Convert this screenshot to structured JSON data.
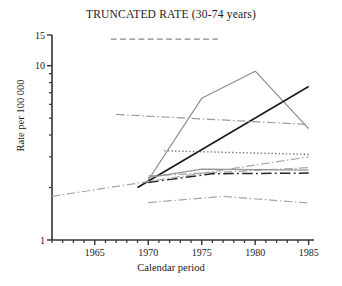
{
  "chart_data": {
    "type": "line",
    "title": "TRUNCATED RATE (30-74 years)",
    "xlabel": "Calendar period",
    "ylabel": "Rate per 100 000",
    "yscale": "log",
    "ylim": [
      1,
      15
    ],
    "xlim": [
      1961,
      1985.5
    ],
    "ytick_labels": [
      "1",
      "10",
      "15"
    ],
    "ytick_values": [
      1,
      10,
      15
    ],
    "yminor_ticks": [
      2,
      3,
      4,
      5,
      6,
      7,
      8,
      9
    ],
    "xtick_labels": [
      "1965",
      "1970",
      "1975",
      "1980",
      "1985"
    ],
    "xtick_values": [
      1965,
      1970,
      1975,
      1980,
      1985
    ],
    "xminor_step": 1,
    "grid": false,
    "legend": "none",
    "series": [
      {
        "name": "series-peaked-gray",
        "style": "solid",
        "color": "#8c8c8c",
        "width": 1.2,
        "x": [
          1970,
          1975,
          1980,
          1985
        ],
        "y": [
          2.21,
          6.5,
          9.3,
          4.35
        ]
      },
      {
        "name": "series-rising-black",
        "style": "solid",
        "color": "#1a1a1a",
        "width": 1.6,
        "x": [
          1969,
          1985
        ],
        "y": [
          2.0,
          7.6
        ]
      },
      {
        "name": "series-flat-top-dashed",
        "style": "dashed",
        "color": "#888888",
        "width": 1.3,
        "x": [
          1966.5,
          1976.5
        ],
        "y": [
          14.2,
          14.2
        ]
      },
      {
        "name": "series-dashdot-gray-upper",
        "style": "dashdot",
        "color": "#9a9a9a",
        "width": 1.2,
        "x": [
          1967,
          1985
        ],
        "y": [
          5.25,
          4.6
        ]
      },
      {
        "name": "series-dotted",
        "style": "dotted",
        "color": "#6e6e6e",
        "width": 1.3,
        "x": [
          1971.5,
          1985
        ],
        "y": [
          3.25,
          3.1
        ]
      },
      {
        "name": "series-dashdot-gray-mid",
        "style": "dashdot",
        "color": "#a0a0a0",
        "width": 1.2,
        "x": [
          1970,
          1985
        ],
        "y": [
          2.33,
          2.6
        ]
      },
      {
        "name": "series-solid-gray-mid",
        "style": "solid",
        "color": "#949494",
        "width": 1.2,
        "x": [
          1970,
          1975,
          1985
        ],
        "y": [
          2.28,
          2.55,
          2.52
        ]
      },
      {
        "name": "series-dashdot-black-mid",
        "style": "dashdot",
        "color": "#262626",
        "width": 1.5,
        "x": [
          1970,
          1976,
          1985
        ],
        "y": [
          2.14,
          2.4,
          2.42
        ]
      },
      {
        "name": "series-dashdot-gray-long-rising",
        "style": "dashdot",
        "color": "#a6a6a6",
        "width": 1.2,
        "x": [
          1961,
          1985
        ],
        "y": [
          1.78,
          3.0
        ]
      },
      {
        "name": "series-dashdot-gray-lower",
        "style": "dashdot",
        "color": "#a6a6a6",
        "width": 1.2,
        "x": [
          1970,
          1977,
          1985
        ],
        "y": [
          1.64,
          1.78,
          1.63
        ]
      }
    ]
  }
}
